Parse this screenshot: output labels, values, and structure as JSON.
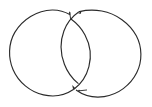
{
  "figure": {
    "title": "Two overlapping circles",
    "type": "venn-diagram",
    "background_color": "#ffffff",
    "stroke_color": "#2b2b2b",
    "stroke_width": 1.15,
    "canvas": {
      "width": 152,
      "height": 107
    },
    "shapes": [
      {
        "name": "left-circle",
        "kind": "circle-outline",
        "center_x": 53,
        "center_y": 53,
        "radius": 43,
        "filled": false
      },
      {
        "name": "right-circle",
        "kind": "circle-outline",
        "center_x": 97,
        "center_y": 53,
        "radius": 43,
        "filled": false
      }
    ],
    "overlap_region": {
      "name": "lens-intersection",
      "kind": "vesica-piscis",
      "top_point_x": 75,
      "top_point_y": 15,
      "bottom_point_x": 75,
      "bottom_point_y": 91
    }
  }
}
